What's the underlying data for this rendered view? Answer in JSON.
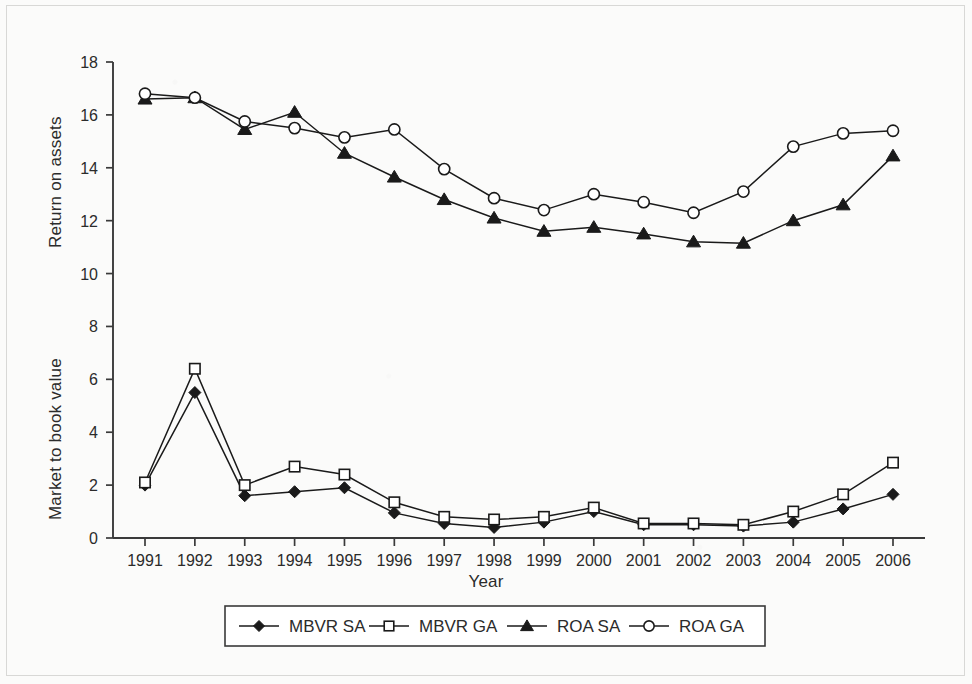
{
  "chart_data": {
    "type": "line",
    "title": "",
    "xlabel": "Year",
    "ylabel_primary": "Return on assets",
    "ylabel_secondary": "Market to book value",
    "grid": false,
    "legend_position": "bottom",
    "xlim": [
      1991,
      2006
    ],
    "ylim": [
      0,
      18
    ],
    "ytick_step": 2,
    "yticks": [
      "0",
      "2",
      "4",
      "6",
      "8",
      "10",
      "12",
      "14",
      "16",
      "18"
    ],
    "categories": [
      "1991",
      "1992",
      "1993",
      "1994",
      "1995",
      "1996",
      "1997",
      "1998",
      "1999",
      "2000",
      "2001",
      "2002",
      "2003",
      "2004",
      "2005",
      "2006"
    ],
    "series": [
      {
        "name": "MBVR SA",
        "marker": "filled-diamond",
        "color": "#1a1a1a",
        "values": [
          2.0,
          5.5,
          1.6,
          1.75,
          1.9,
          0.95,
          0.55,
          0.4,
          0.6,
          1.0,
          0.5,
          0.5,
          0.45,
          0.6,
          1.1,
          1.65
        ]
      },
      {
        "name": "MBVR GA",
        "marker": "open-square",
        "color": "#1a1a1a",
        "values": [
          2.1,
          6.4,
          2.0,
          2.7,
          2.4,
          1.35,
          0.8,
          0.7,
          0.8,
          1.15,
          0.55,
          0.55,
          0.5,
          1.0,
          1.65,
          2.85
        ]
      },
      {
        "name": "ROA SA",
        "marker": "filled-triangle",
        "color": "#1a1a1a",
        "values": [
          16.6,
          16.65,
          15.45,
          16.1,
          14.55,
          13.65,
          12.8,
          12.1,
          11.6,
          11.75,
          11.5,
          11.2,
          11.15,
          12.0,
          12.6,
          14.45
        ]
      },
      {
        "name": "ROA GA",
        "marker": "open-circle",
        "color": "#1a1a1a",
        "values": [
          16.8,
          16.65,
          15.75,
          15.5,
          15.15,
          15.45,
          13.95,
          12.85,
          12.4,
          13.0,
          12.7,
          12.3,
          13.1,
          14.8,
          15.3,
          15.4
        ]
      }
    ]
  },
  "axes": {
    "x_title": "Year",
    "y_title_upper": "Return on assets",
    "y_title_lower": "Market to book value"
  },
  "legend": {
    "items": [
      {
        "label": "MBVR SA",
        "marker": "filled-diamond"
      },
      {
        "label": "MBVR GA",
        "marker": "open-square"
      },
      {
        "label": "ROA SA",
        "marker": "filled-triangle"
      },
      {
        "label": "ROA GA",
        "marker": "open-circle"
      }
    ]
  },
  "colors": {
    "ink": "#1a1a1a",
    "axis": "#3a3a3a",
    "paper": "#fbfbfa"
  }
}
